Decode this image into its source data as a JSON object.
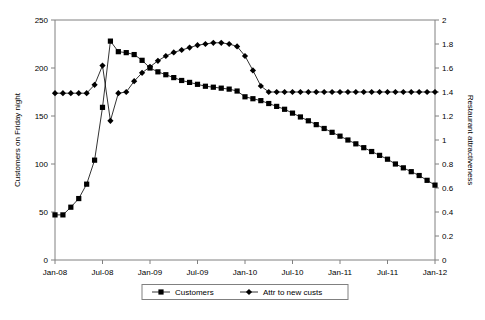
{
  "chart_data": {
    "type": "line",
    "title": "",
    "xlabel": "",
    "ylabel": "Customers on Friday night",
    "y2label": "Restaurant attractiveness",
    "grid": false,
    "legend_position": "bottom",
    "ylim": [
      0,
      250
    ],
    "y2lim": [
      0,
      2
    ],
    "yticks": [
      0,
      50,
      100,
      150,
      200,
      250
    ],
    "y2ticks": [
      0,
      0.2,
      0.4,
      0.6,
      0.8,
      1,
      1.2,
      1.4,
      1.6,
      1.8,
      2
    ],
    "ytick_labels": [
      "0",
      "50",
      "100",
      "150",
      "200",
      "250"
    ],
    "y2tick_labels": [
      "0",
      "0.2",
      "0.4",
      "0.6",
      "0.8",
      "1",
      "1.2",
      "1.4",
      "1.6",
      "1.8",
      "2"
    ],
    "xtick_labels": [
      "Jan-08",
      "Jul-08",
      "Jan-09",
      "Jul-09",
      "Jan-10",
      "Jul-10",
      "Jan-11",
      "Jul-11",
      "Jan-12"
    ],
    "xtick_indices": [
      0,
      6,
      12,
      18,
      24,
      30,
      36,
      42,
      48
    ],
    "x": [
      0,
      1,
      2,
      3,
      4,
      5,
      6,
      7,
      8,
      9,
      10,
      11,
      12,
      13,
      14,
      15,
      16,
      17,
      18,
      19,
      20,
      21,
      22,
      23,
      24,
      25,
      26,
      27,
      28,
      29,
      30,
      31,
      32,
      33,
      34,
      35,
      36,
      37,
      38,
      39,
      40,
      41,
      42,
      43,
      44,
      45,
      46,
      47,
      48
    ],
    "series": [
      {
        "name": "Customers",
        "axis": "left",
        "marker": "square",
        "values": [
          47,
          47,
          55,
          64,
          79,
          104,
          159,
          228,
          217,
          216,
          214,
          208,
          200,
          196,
          193,
          190,
          187,
          185,
          183,
          181,
          180,
          179,
          178,
          176,
          170,
          168,
          166,
          163,
          160,
          157,
          153,
          149,
          145,
          141,
          137,
          133,
          129,
          125,
          121,
          117,
          113,
          109,
          105,
          100,
          96,
          92,
          88,
          83,
          78
        ]
      },
      {
        "name": "Attr to new custs",
        "axis": "right",
        "marker": "diamond",
        "values": [
          1.39,
          1.39,
          1.39,
          1.39,
          1.39,
          1.46,
          1.62,
          1.16,
          1.39,
          1.4,
          1.49,
          1.56,
          1.61,
          1.66,
          1.7,
          1.73,
          1.75,
          1.77,
          1.79,
          1.8,
          1.81,
          1.81,
          1.8,
          1.78,
          1.7,
          1.58,
          1.45,
          1.4,
          1.4,
          1.4,
          1.4,
          1.4,
          1.4,
          1.4,
          1.4,
          1.4,
          1.4,
          1.4,
          1.4,
          1.4,
          1.4,
          1.4,
          1.4,
          1.4,
          1.4,
          1.4,
          1.4,
          1.4,
          1.4
        ]
      }
    ]
  },
  "legend": {
    "items": [
      {
        "label": "Customers",
        "marker": "square"
      },
      {
        "label": "Attr to new custs",
        "marker": "diamond"
      }
    ]
  },
  "colors": {
    "series": "#000000",
    "axis": "#808080",
    "background": "#ffffff"
  }
}
